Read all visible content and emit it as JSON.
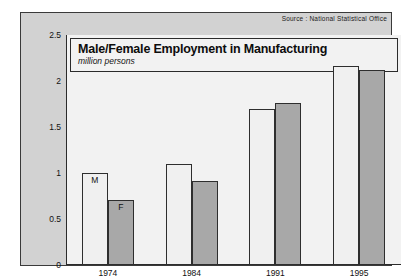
{
  "source_note": "Source : National Statistical Office",
  "chart_data": {
    "type": "bar",
    "title": "Male/Female Employment in Manufacturing",
    "subtitle": "million persons",
    "xlabel": "",
    "ylabel": "",
    "ylim": [
      0,
      2.5
    ],
    "yticks": [
      "0",
      "0.5",
      "1",
      "1.5",
      "2",
      "2.5"
    ],
    "ytick_values": [
      0,
      0.5,
      1,
      1.5,
      2,
      2.5
    ],
    "grid": false,
    "legend": "inline-bar-labels",
    "categories": [
      "1974",
      "1984",
      "1991",
      "1995"
    ],
    "series": [
      {
        "name": "M",
        "label": "M",
        "color": "#f0f0f0",
        "values": [
          1.0,
          1.1,
          1.7,
          2.16
        ]
      },
      {
        "name": "F",
        "label": "F",
        "color": "#a8a8a8",
        "values": [
          0.71,
          0.91,
          1.76,
          2.12
        ]
      }
    ],
    "bar_labels": {
      "male": "M",
      "female": "F"
    },
    "bar_labels_shown_on_group": "1974"
  }
}
